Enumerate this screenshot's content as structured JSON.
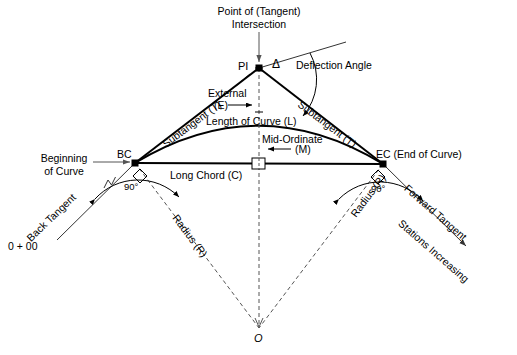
{
  "diagram": {
    "colors": {
      "line": "#000000",
      "dashed": "#555555",
      "background": "#ffffff",
      "text": "#000000"
    },
    "labels": {
      "point_of_intersection_line1": "Point of (Tangent)",
      "point_of_intersection_line2": "Intersection",
      "pi": "PI",
      "delta": "Δ",
      "deflection_angle": "Deflection Angle",
      "external_word": "External",
      "external_symbol": "(E)",
      "length_of_curve": "Length of Curve (L)",
      "subtangent_left": "Subtangent (T)",
      "subtangent_right": "Subtangent (T)",
      "mid_ordinate_word": "Mid-Ordinate",
      "mid_ordinate_symbol": "(M)",
      "beginning_of_curve_line1": "Beginning",
      "beginning_of_curve_line2": "of Curve",
      "bc": "BC",
      "ec": "EC (End of Curve)",
      "long_chord": "Long Chord (C)",
      "angle_left": "90°",
      "angle_right": "90°",
      "back_tangent": "Back Tangent",
      "forward_tangent": "Forward Tangent",
      "stations_increasing": "Stations Increasing",
      "station_zero": "0 + 00",
      "radius_left": "Radius (R)",
      "radius_right": "Radius (R)",
      "center": "O"
    },
    "geometry": {
      "pi": [
        259,
        68
      ],
      "bc": [
        135,
        163
      ],
      "ec": [
        383,
        164
      ],
      "center": [
        259,
        328
      ],
      "curve_apex": [
        259,
        128
      ],
      "back_tangent_start": [
        57,
        240
      ],
      "forward_tangent_end": [
        466,
        246
      ],
      "chord_midpoint": [
        259,
        163
      ]
    }
  }
}
